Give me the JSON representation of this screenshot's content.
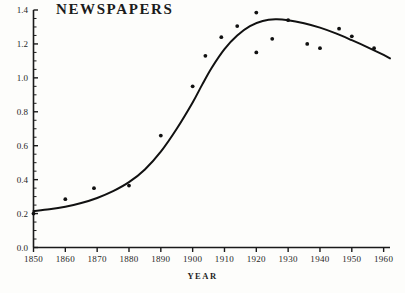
{
  "chart_data": {
    "type": "scatter",
    "title": "NEWSPAPERS",
    "xlabel": "YEAR",
    "ylabel": "",
    "xlim": [
      1850,
      1962
    ],
    "ylim": [
      0.0,
      1.4
    ],
    "grid": false,
    "legend": null,
    "x_ticks": [
      1850,
      1860,
      1870,
      1880,
      1890,
      1900,
      1910,
      1920,
      1930,
      1940,
      1950,
      1960
    ],
    "x_tick_labels": [
      "1850",
      "1860",
      "1870",
      "1880",
      "1890",
      "1900",
      "1910",
      "1920",
      "1930",
      "1940",
      "1950",
      "1960"
    ],
    "y_ticks": [
      0.0,
      0.2,
      0.4,
      0.6,
      0.8,
      1.0,
      1.2,
      1.4
    ],
    "y_tick_labels": [
      "0.0",
      "0.2",
      "0.4",
      "0.6",
      "0.8",
      "1.0",
      "1.2",
      "1.4"
    ],
    "y_minor_tick_step": 0.05,
    "series": [
      {
        "name": "observed",
        "type": "scatter",
        "marker": "filled-circle",
        "color": "#111111",
        "points": [
          {
            "x": 1850,
            "y": 0.2
          },
          {
            "x": 1860,
            "y": 0.285
          },
          {
            "x": 1869,
            "y": 0.35
          },
          {
            "x": 1880,
            "y": 0.365
          },
          {
            "x": 1890,
            "y": 0.66
          },
          {
            "x": 1900,
            "y": 0.95
          },
          {
            "x": 1904,
            "y": 1.13
          },
          {
            "x": 1909,
            "y": 1.24
          },
          {
            "x": 1914,
            "y": 1.305
          },
          {
            "x": 1920,
            "y": 1.385
          },
          {
            "x": 1920,
            "y": 1.15
          },
          {
            "x": 1925,
            "y": 1.23
          },
          {
            "x": 1930,
            "y": 1.34
          },
          {
            "x": 1936,
            "y": 1.2
          },
          {
            "x": 1940,
            "y": 1.175
          },
          {
            "x": 1946,
            "y": 1.29
          },
          {
            "x": 1950,
            "y": 1.245
          },
          {
            "x": 1957,
            "y": 1.175
          }
        ]
      },
      {
        "name": "fitted-curve",
        "type": "line",
        "color": "#111111",
        "points": [
          {
            "x": 1850,
            "y": 0.215
          },
          {
            "x": 1855,
            "y": 0.225
          },
          {
            "x": 1860,
            "y": 0.24
          },
          {
            "x": 1865,
            "y": 0.262
          },
          {
            "x": 1870,
            "y": 0.292
          },
          {
            "x": 1875,
            "y": 0.332
          },
          {
            "x": 1880,
            "y": 0.385
          },
          {
            "x": 1885,
            "y": 0.46
          },
          {
            "x": 1890,
            "y": 0.565
          },
          {
            "x": 1895,
            "y": 0.7
          },
          {
            "x": 1900,
            "y": 0.855
          },
          {
            "x": 1903,
            "y": 0.96
          },
          {
            "x": 1906,
            "y": 1.06
          },
          {
            "x": 1910,
            "y": 1.17
          },
          {
            "x": 1914,
            "y": 1.25
          },
          {
            "x": 1918,
            "y": 1.305
          },
          {
            "x": 1922,
            "y": 1.335
          },
          {
            "x": 1926,
            "y": 1.345
          },
          {
            "x": 1930,
            "y": 1.34
          },
          {
            "x": 1935,
            "y": 1.322
          },
          {
            "x": 1940,
            "y": 1.296
          },
          {
            "x": 1945,
            "y": 1.262
          },
          {
            "x": 1950,
            "y": 1.222
          },
          {
            "x": 1955,
            "y": 1.18
          },
          {
            "x": 1960,
            "y": 1.135
          },
          {
            "x": 1962,
            "y": 1.115
          }
        ]
      }
    ]
  },
  "figure": {
    "background_color": "#fdfdfb",
    "ink_color": "#111111"
  }
}
